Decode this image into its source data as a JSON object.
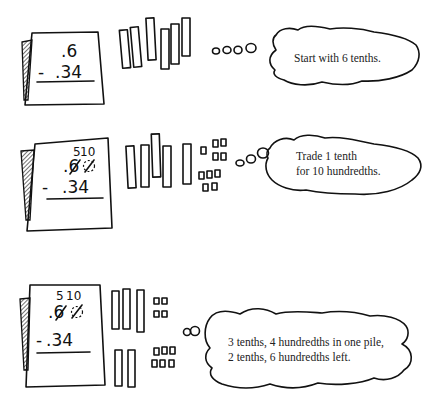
{
  "steps": [
    {
      "problem": {
        "top": ".6",
        "bottom": "- .34",
        "minus": "-",
        "bottom_value": ".34"
      },
      "tenths_count": 6,
      "hundredths_count": 0,
      "bubble": {
        "lines": [
          "Start with 6 tenths."
        ]
      }
    },
    {
      "problem": {
        "regroup_tenths": "5",
        "regroup_hundredths": "10",
        "top": ".6",
        "bottom": "- .34",
        "minus": "-",
        "bottom_value": ".34"
      },
      "tenths_count": 5,
      "hundredths_count": 10,
      "bubble": {
        "lines": [
          "Trade 1 tenth",
          "for 10 hundredths."
        ]
      }
    },
    {
      "problem": {
        "regroup_tenths": "5",
        "regroup_hundredths": "10",
        "top": ".6",
        "bottom": "-.34",
        "minus": "-",
        "bottom_value": ".34"
      },
      "pile_taken": {
        "tenths": 3,
        "hundredths": 4
      },
      "pile_left": {
        "tenths": 2,
        "hundredths": 6
      },
      "bubble": {
        "lines": [
          "3 tenths, 4 hundredths in one pile,",
          "2 tenths, 6 hundredths left."
        ]
      }
    }
  ]
}
